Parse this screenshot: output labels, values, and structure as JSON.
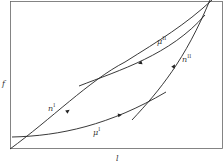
{
  "diagram": {
    "axes": {
      "x_label": "l",
      "y_label": "f"
    },
    "curves": [
      {
        "id": "n1",
        "label": "n",
        "sup": "I"
      },
      {
        "id": "n2",
        "label": "n",
        "sup": "II"
      },
      {
        "id": "mu1",
        "label": "μ",
        "sup": "I"
      },
      {
        "id": "mu2",
        "label": "μ",
        "sup": "II"
      }
    ],
    "colors": {
      "line": "#222222",
      "frame": "#555555"
    }
  }
}
